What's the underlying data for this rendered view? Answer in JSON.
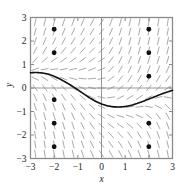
{
  "figure": {
    "kind": "slope-field-with-solution-curve",
    "background_color": "#ffffff",
    "frame_color": "#8a8a8a",
    "axis_color": "#8a8a8a",
    "slope_mark_color": "#9a9a9a",
    "curve_color": "#111111",
    "point_color": "#111111"
  },
  "chart_data": {
    "type": "line",
    "title": "",
    "subtitle": "",
    "xlabel": "x",
    "ylabel": "y",
    "xlim": [
      -3,
      3
    ],
    "ylim": [
      -3,
      3
    ],
    "grid": false,
    "legend": "none",
    "x_ticks": [
      -3,
      -2,
      -1,
      0,
      1,
      2,
      3
    ],
    "x_tick_labels": [
      "-3",
      "-2",
      "-1",
      "0",
      "1",
      "2",
      "3"
    ],
    "y_ticks": [
      -3,
      -2,
      -1,
      0,
      1,
      2,
      3
    ],
    "y_tick_labels": [
      "-3",
      "-2",
      "-1",
      "0",
      "1",
      "2",
      "3"
    ],
    "series": [
      {
        "name": "solution-curve",
        "kind": "curve",
        "x": [
          -3.0,
          -2.75,
          -2.5,
          -2.25,
          -2.0,
          -1.75,
          -1.5,
          -1.25,
          -1.0,
          -0.75,
          -0.5,
          -0.25,
          0.0,
          0.25,
          0.5,
          0.75,
          1.0,
          1.25,
          1.5,
          1.75,
          2.0,
          2.25,
          2.5,
          2.75,
          3.0
        ],
        "y": [
          0.65,
          0.66,
          0.64,
          0.59,
          0.5,
          0.38,
          0.24,
          0.09,
          -0.08,
          -0.25,
          -0.42,
          -0.57,
          -0.68,
          -0.76,
          -0.8,
          -0.81,
          -0.79,
          -0.74,
          -0.66,
          -0.57,
          -0.47,
          -0.37,
          -0.27,
          -0.18,
          -0.1
        ]
      },
      {
        "name": "marked-points",
        "kind": "scatter",
        "points": [
          {
            "x": -2,
            "y": 2.5
          },
          {
            "x": -2,
            "y": 1.5
          },
          {
            "x": -2,
            "y": -0.5
          },
          {
            "x": -2,
            "y": -1.5
          },
          {
            "x": -2,
            "y": -2.5
          },
          {
            "x": 2,
            "y": 2.5
          },
          {
            "x": 2,
            "y": 1.5
          },
          {
            "x": 2,
            "y": 0.5
          },
          {
            "x": 2,
            "y": -1.5
          },
          {
            "x": 2,
            "y": -2.5
          }
        ]
      }
    ],
    "slope_field": {
      "description": "short dashes indicating solution slopes on a grid over the domain",
      "x_start": -2.8,
      "x_end": 2.8,
      "y_start": -2.8,
      "y_end": 2.8,
      "x_step": 0.4,
      "y_step": 0.4,
      "mark_length": 8
    }
  }
}
